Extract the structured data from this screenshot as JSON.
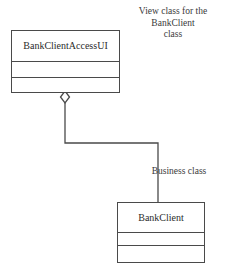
{
  "diagram": {
    "type": "uml-class-diagram",
    "background_color": "#ffffff",
    "stroke_color": "#4a4a4a",
    "text_color": "#2b2b2b"
  },
  "annotations": [
    {
      "id": "view-class-note",
      "text": "View class for the\nBankClient\nclass"
    },
    {
      "id": "business-class-note",
      "text": "Business class"
    }
  ],
  "classes": [
    {
      "id": "bank-client-access-ui",
      "name": "BankClientAccessUI",
      "attributes": [],
      "operations": [],
      "compartment_count": 3
    },
    {
      "id": "bank-client",
      "name": "BankClient",
      "attributes": [],
      "operations": [],
      "compartment_count": 3
    }
  ],
  "relationship": {
    "id": "aggregation",
    "kind": "aggregation",
    "marker": "open-diamond",
    "source": "BankClientAccessUI",
    "target": "BankClient",
    "label": ""
  }
}
